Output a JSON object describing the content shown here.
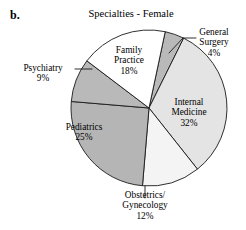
{
  "panel": {
    "label": "b."
  },
  "chart_data": {
    "type": "pie",
    "title": "Specialties - Female",
    "subtitle": "",
    "xlabel": "",
    "ylabel": "",
    "legend_position": "none",
    "grid": false,
    "units": "percent",
    "start_angle_deg": -78,
    "direction": "clockwise",
    "categories": [
      "General Surgery",
      "Internal Medicine",
      "Obstetrics/Gynecology",
      "Pediatrics",
      "Psychiatry",
      "Family Practice"
    ],
    "values": [
      4,
      32,
      12,
      25,
      9,
      18
    ],
    "total": 100,
    "slices": [
      {
        "name": "General Surgery",
        "label_line1": "General",
        "label_line2": "Surgery",
        "value": 4,
        "pct_text": "4%",
        "color": "#b9b9b9",
        "callout": true
      },
      {
        "name": "Internal Medicine",
        "label_line1": "Internal",
        "label_line2": "Medicine",
        "value": 32,
        "pct_text": "32%",
        "color": "#e4e4e4",
        "callout": false
      },
      {
        "name": "Obstetrics/Gynecology",
        "label_line1": "Obstetrics/",
        "label_line2": "Gynecology",
        "value": 12,
        "pct_text": "12%",
        "color": "#f4f4f4",
        "callout": true
      },
      {
        "name": "Pediatrics",
        "label_line1": "Pediatrics",
        "label_line2": "",
        "value": 25,
        "pct_text": "25%",
        "color": "#b5b5b5",
        "callout": false
      },
      {
        "name": "Psychiatry",
        "label_line1": "Psychiatry",
        "label_line2": "",
        "value": 9,
        "pct_text": "9%",
        "color": "#b9b9b9",
        "callout": true
      },
      {
        "name": "Family Practice",
        "label_line1": "Family",
        "label_line2": "Practice",
        "value": 18,
        "pct_text": "18%",
        "color": "#ffffff",
        "callout": false
      }
    ]
  },
  "colors": {
    "outline": "#1a1a1a",
    "background": "#ffffff",
    "text": "#000000"
  }
}
